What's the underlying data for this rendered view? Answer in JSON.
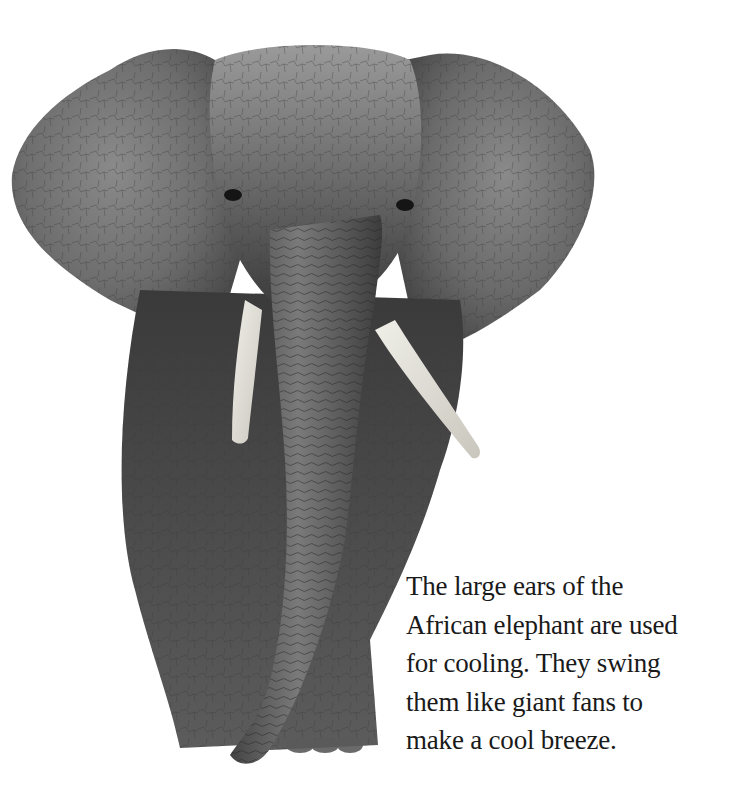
{
  "page": {
    "image": {
      "subject": "African elephant, front view, black and white",
      "alt": "African elephant facing forward with ears spread"
    },
    "caption": {
      "lines": [
        "The large ears of the",
        "African elephant are used",
        "for cooling. They swing",
        "them like giant fans to",
        "make a cool breeze."
      ]
    }
  }
}
